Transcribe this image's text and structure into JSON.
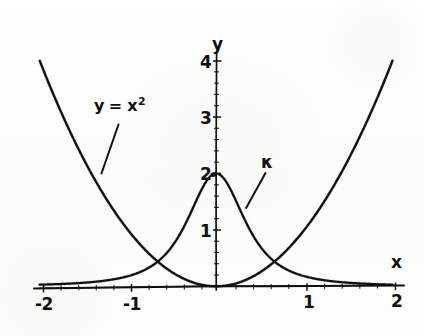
{
  "figure": {
    "background_color": "#fdfdfc",
    "ink_color": "#101010",
    "width": 424,
    "height": 336
  },
  "axes": {
    "x_axis_name": "x",
    "y_axis_name": "y",
    "x_tick_labels": [
      "-2",
      "-1",
      "1",
      "2"
    ],
    "y_tick_labels": [
      "1",
      "2",
      "3",
      "4"
    ]
  },
  "annotations": {
    "parabola": {
      "text_y": "y",
      "text_eq": "=",
      "text_x": "x",
      "text_sup": "2"
    },
    "curvature": {
      "symbol": "κ"
    }
  },
  "chart_data": {
    "type": "line",
    "title": "",
    "subtitle": "",
    "xlabel": "x",
    "ylabel": "y",
    "xlim": [
      -2.05,
      2.05
    ],
    "ylim": [
      0,
      4.35
    ],
    "grid": false,
    "legend": "none",
    "xticks": [
      -2,
      -1,
      1,
      2
    ],
    "yticks": [
      1,
      2,
      3,
      4
    ],
    "xtick_labels": [
      "-2",
      "-1",
      "1",
      "2"
    ],
    "ytick_labels": [
      "1",
      "2",
      "3",
      "4"
    ],
    "annotations": [
      {
        "name": "parabola-label",
        "text": "y = x^2",
        "data_x": -1.37,
        "data_y": 3.3,
        "leader_to": {
          "data_x": -1.3,
          "data_y": 2.0
        }
      },
      {
        "name": "curvature-label",
        "text": "κ",
        "data_x": 0.56,
        "data_y": 2.26,
        "leader_to": {
          "data_x": 0.34,
          "data_y": 1.39
        }
      }
    ],
    "series": [
      {
        "name": "y = x^2",
        "formula": "y = x*x",
        "color": "#101010",
        "x": [
          -2.0,
          -1.9,
          -1.8,
          -1.7,
          -1.6,
          -1.5,
          -1.4,
          -1.3,
          -1.2,
          -1.1,
          -1.0,
          -0.9,
          -0.8,
          -0.7,
          -0.6,
          -0.5,
          -0.4,
          -0.3,
          -0.2,
          -0.1,
          0.0,
          0.1,
          0.2,
          0.3,
          0.4,
          0.5,
          0.6,
          0.7,
          0.8,
          0.9,
          1.0,
          1.1,
          1.2,
          1.3,
          1.4,
          1.5,
          1.6,
          1.7,
          1.8,
          1.9,
          2.0
        ],
        "values": [
          4.0,
          3.61,
          3.24,
          2.89,
          2.56,
          2.25,
          1.96,
          1.69,
          1.44,
          1.21,
          1.0,
          0.81,
          0.64,
          0.49,
          0.36,
          0.25,
          0.16,
          0.09,
          0.04,
          0.01,
          0.0,
          0.01,
          0.04,
          0.09,
          0.16,
          0.25,
          0.36,
          0.49,
          0.64,
          0.81,
          1.0,
          1.21,
          1.44,
          1.69,
          1.96,
          2.25,
          2.56,
          2.89,
          3.24,
          3.61,
          4.0
        ]
      },
      {
        "name": "κ",
        "formula": "k = 2 / (1 + 4*x*x)^(3/2)",
        "color": "#101010",
        "x": [
          -2.0,
          -1.9,
          -1.8,
          -1.7,
          -1.6,
          -1.5,
          -1.4,
          -1.3,
          -1.2,
          -1.1,
          -1.0,
          -0.9,
          -0.8,
          -0.7,
          -0.6,
          -0.5,
          -0.4,
          -0.3,
          -0.2,
          -0.1,
          0.0,
          0.1,
          0.2,
          0.3,
          0.4,
          0.5,
          0.6,
          0.7,
          0.8,
          0.9,
          1.0,
          1.1,
          1.2,
          1.3,
          1.4,
          1.5,
          1.6,
          1.7,
          1.8,
          1.9,
          2.0
        ],
        "values": [
          0.0305,
          0.0355,
          0.0417,
          0.0494,
          0.0592,
          0.0716,
          0.0879,
          0.1094,
          0.1384,
          0.1784,
          0.2345,
          0.3151,
          0.4334,
          0.6097,
          0.8711,
          1.2403,
          1.6946,
          2.0,
          1.9621,
          1.7199,
          2.0,
          1.7199,
          1.9621,
          2.0,
          1.6946,
          1.2403,
          0.8711,
          0.6097,
          0.4334,
          0.3151,
          0.2345,
          0.1784,
          0.1384,
          0.1094,
          0.0879,
          0.0716,
          0.0592,
          0.0494,
          0.0417,
          0.0355,
          0.0305
        ]
      }
    ]
  }
}
